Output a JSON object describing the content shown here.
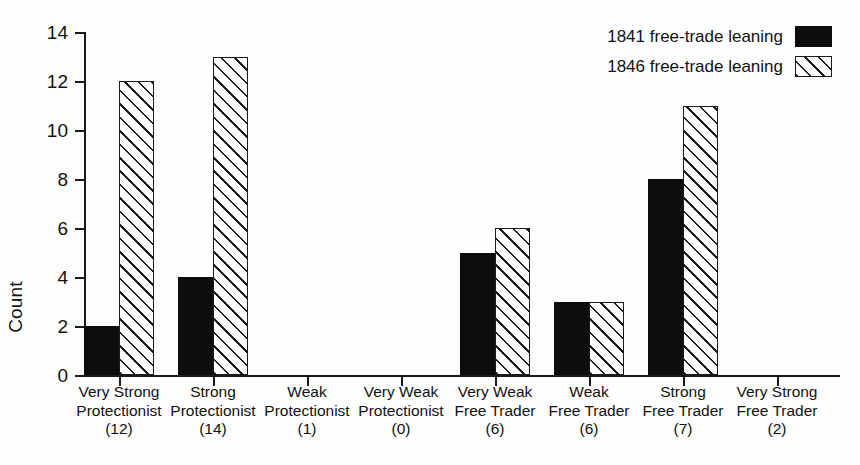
{
  "chart_data": {
    "type": "bar",
    "title": "",
    "xlabel": "",
    "ylabel": "Count",
    "ylim": [
      0,
      14
    ],
    "ytick_values": [
      0,
      2,
      4,
      6,
      8,
      10,
      12,
      14
    ],
    "ytick_labels": [
      "0",
      "2",
      "4",
      "6",
      "8",
      "10",
      "12",
      "14"
    ],
    "grid": false,
    "legend_position": "top-right",
    "categories": [
      "Very Strong Protectionist (12)",
      "Strong Protectionist (14)",
      "Weak Protectionist (1)",
      "Very Weak Protectionist (0)",
      "Very Weak Free Trader (6)",
      "Weak Free Trader (6)",
      "Strong Free Trader (7)",
      "Very Strong Free Trader (2)"
    ],
    "category_lines": [
      [
        "Very Strong",
        "Protectionist",
        "(12)"
      ],
      [
        "Strong",
        "Protectionist",
        "(14)"
      ],
      [
        "Weak",
        "Protectionist",
        "(1)"
      ],
      [
        "Very Weak",
        "Protectionist",
        "(0)"
      ],
      [
        "Very Weak",
        "Free Trader",
        "(6)"
      ],
      [
        "Weak",
        "Free Trader",
        "(6)"
      ],
      [
        "Strong",
        "Free Trader",
        "(7)"
      ],
      [
        "Very Strong",
        "Free Trader",
        "(2)"
      ]
    ],
    "series": [
      {
        "name": "1841 free-trade leaning",
        "style": "solid",
        "color": "#0d0d0d",
        "values": [
          2,
          4,
          0,
          0,
          5,
          3,
          8,
          0
        ]
      },
      {
        "name": "1846 free-trade leaning",
        "style": "hatch",
        "color": "#ffffff",
        "values": [
          12,
          13,
          0,
          0,
          6,
          3,
          11,
          0
        ]
      }
    ]
  },
  "legend": {
    "items": [
      {
        "label": "1841 free-trade leaning",
        "style": "solid"
      },
      {
        "label": "1846 free-trade leaning",
        "style": "hatch"
      }
    ]
  },
  "axis": {
    "ylabel": "Count"
  }
}
